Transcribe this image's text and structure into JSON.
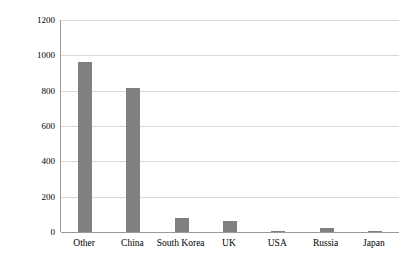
{
  "chart_data": {
    "type": "bar",
    "title": "",
    "subtitle": "",
    "xlabel": "",
    "ylabel": "x 1000",
    "categories": [
      "Other",
      "China",
      "South Korea",
      "UK",
      "USA",
      "Russia",
      "Japan"
    ],
    "values": [
      965,
      818,
      80,
      63,
      8,
      20,
      5
    ],
    "series": [
      {
        "name": "",
        "values": [
          965,
          818,
          80,
          63,
          8,
          20,
          5
        ]
      }
    ],
    "ylim": [
      0,
      1200
    ],
    "yticks": [
      0,
      200,
      400,
      600,
      800,
      1000,
      1200
    ],
    "ytick_labels": [
      "0",
      "200",
      "400",
      "600",
      "800",
      "1000",
      "1200"
    ],
    "grid": true,
    "grid_axis": "y",
    "legend": false,
    "legend_position": "none",
    "bar_color": "#808080",
    "gridline_color": "#D9D9D9",
    "axis_color": "#9A9A9A",
    "background_color": "#FFFFFF"
  }
}
